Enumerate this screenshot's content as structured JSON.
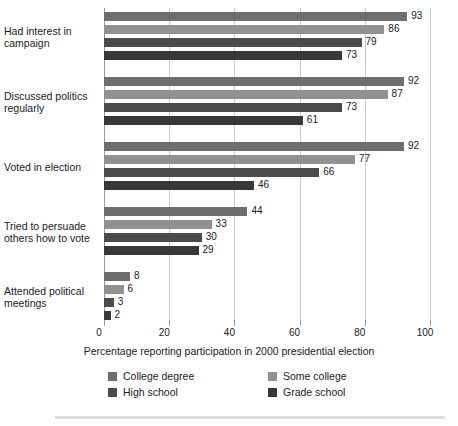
{
  "chart_data": {
    "type": "bar",
    "orientation": "horizontal",
    "title": "",
    "xlabel": "Percentage reporting participation in 2000 presidential election",
    "ylabel": "",
    "xlim": [
      0,
      100
    ],
    "xticks": [
      0,
      20,
      40,
      60,
      80,
      100
    ],
    "grid": true,
    "legend_position": "bottom",
    "categories": [
      "Had interest in campaign",
      "Discussed politics regularly",
      "Voted in election",
      "Tried to persuade others how to vote",
      "Attended political meetings"
    ],
    "category_labels": [
      [
        "Had interest in",
        "campaign"
      ],
      [
        "Discussed politics",
        "regularly"
      ],
      [
        "Voted in election"
      ],
      [
        "Tried to persuade",
        "others how to vote"
      ],
      [
        "Attended political",
        "meetings"
      ]
    ],
    "series": [
      {
        "name": "College degree",
        "color": "#6e6e6e",
        "values": [
          93,
          92,
          92,
          44,
          8
        ]
      },
      {
        "name": "Some college",
        "color": "#919191",
        "values": [
          86,
          87,
          77,
          33,
          6
        ]
      },
      {
        "name": "High school",
        "color": "#4b4b4b",
        "values": [
          79,
          73,
          66,
          30,
          3
        ]
      },
      {
        "name": "Grade school",
        "color": "#383838",
        "values": [
          73,
          61,
          46,
          29,
          2
        ]
      }
    ]
  },
  "axis": {
    "tick_labels": [
      "0",
      "20",
      "40",
      "60",
      "80",
      "100"
    ]
  },
  "legend": {
    "items": [
      {
        "label": "College degree",
        "color": "#6e6e6e"
      },
      {
        "label": "Some college",
        "color": "#919191"
      },
      {
        "label": "High school",
        "color": "#4b4b4b"
      },
      {
        "label": "Grade school",
        "color": "#383838"
      }
    ]
  }
}
